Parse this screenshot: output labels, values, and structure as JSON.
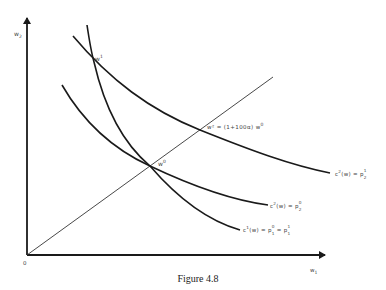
{
  "figure": {
    "caption": "Figure 4.8",
    "axes": {
      "x_label": "w",
      "x_label_sub": "1",
      "y_label": "w",
      "y_label_sub": "2",
      "origin": "0"
    },
    "points": {
      "w1": {
        "base": "w",
        "sup": "1"
      },
      "w0": {
        "base": "w",
        "sup": "0"
      },
      "ray_label": {
        "text": "w² = (1+100α) w",
        "sup": "0"
      }
    },
    "curves": {
      "c2_p21": {
        "text": "c",
        "sup": "2",
        "mid": "(w) = p",
        "sub": "2",
        "sup2": "1"
      },
      "c2_p20": {
        "text": "c",
        "sup": "2",
        "mid": "(w) = p",
        "sub": "2",
        "sup2": "0"
      },
      "c1": {
        "text": "c",
        "sup": "1",
        "mid": "(w) = p",
        "sub": "1",
        "sup2": "0",
        "tail": " = p",
        "sub_b": "1",
        "sup_b": "1"
      }
    },
    "colors": {
      "line": "#1a1a1a",
      "text": "#444444",
      "background": "#ffffff"
    }
  }
}
